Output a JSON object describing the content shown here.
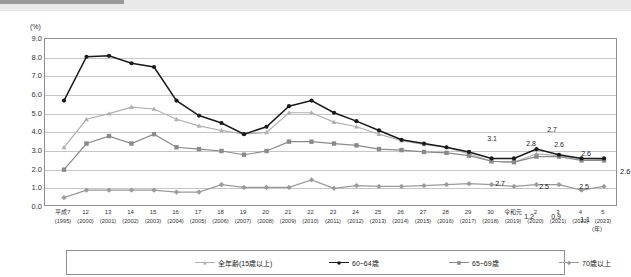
{
  "chart_data": {
    "type": "line",
    "title": "",
    "xlabel": "(年)",
    "ylabel": "(%)",
    "ylim": [
      0.0,
      9.0
    ],
    "yticks": [
      "0.0",
      "1.0",
      "2.0",
      "3.0",
      "4.0",
      "5.0",
      "6.0",
      "7.0",
      "8.0",
      "9.0"
    ],
    "grid": true,
    "legend_position": "bottom",
    "categories": [
      "平成7\n(1995)",
      "12\n(2000)",
      "13\n(2001)",
      "14\n(2002)",
      "15\n(2003)",
      "16\n(2004)",
      "17\n(2005)",
      "18\n(2006)",
      "19\n(2007)",
      "20\n(2008)",
      "21\n(2009)",
      "22\n(2010)",
      "23\n(2011)",
      "24\n(2012)",
      "25\n(2013)",
      "26\n(2014)",
      "27\n(2015)",
      "28\n(2016)",
      "29\n(2017)",
      "30\n(2018)",
      "令和元\n(2019)",
      "2\n(2020)",
      "3\n(2021)",
      "4\n(2022)",
      "5\n(2023)"
    ],
    "x_labels": [
      {
        "line1": "平成7",
        "line2": "(1995)"
      },
      {
        "line1": "12",
        "line2": "(2000)"
      },
      {
        "line1": "13",
        "line2": "(2001)"
      },
      {
        "line1": "14",
        "line2": "(2002)"
      },
      {
        "line1": "15",
        "line2": "(2003)"
      },
      {
        "line1": "16",
        "line2": "(2004)"
      },
      {
        "line1": "17",
        "line2": "(2005)"
      },
      {
        "line1": "18",
        "line2": "(2006)"
      },
      {
        "line1": "19",
        "line2": "(2007)"
      },
      {
        "line1": "20",
        "line2": "(2008)"
      },
      {
        "line1": "21",
        "line2": "(2009)"
      },
      {
        "line1": "22",
        "line2": "(2010)"
      },
      {
        "line1": "23",
        "line2": "(2011)"
      },
      {
        "line1": "24",
        "line2": "(2012)"
      },
      {
        "line1": "25",
        "line2": "(2013)"
      },
      {
        "line1": "26",
        "line2": "(2014)"
      },
      {
        "line1": "27",
        "line2": "(2015)"
      },
      {
        "line1": "28",
        "line2": "(2016)"
      },
      {
        "line1": "29",
        "line2": "(2017)"
      },
      {
        "line1": "30",
        "line2": "(2018)"
      },
      {
        "line1": "令和元",
        "line2": "(2019)"
      },
      {
        "line1": "2",
        "line2": "(2020)"
      },
      {
        "line1": "3",
        "line2": "(2021)"
      },
      {
        "line1": "4",
        "line2": "(2022)"
      },
      {
        "line1": "5",
        "line2": "(2023)"
      }
    ],
    "series": [
      {
        "name": "全年齢(15歳以上)",
        "color": "#b0b0b0",
        "marker": "triangle",
        "values": [
          3.2,
          4.7,
          5.0,
          5.35,
          5.25,
          4.7,
          4.35,
          4.1,
          3.9,
          4.0,
          5.05,
          5.05,
          4.55,
          4.3,
          3.9,
          3.55,
          3.35,
          3.2,
          2.85,
          2.45,
          2.4,
          2.85,
          2.75,
          2.6,
          2.55
        ]
      },
      {
        "name": "60~64歳",
        "color": "#1a1a1a",
        "marker": "circle",
        "values": [
          5.7,
          8.05,
          8.1,
          7.7,
          7.5,
          5.7,
          4.9,
          4.5,
          3.9,
          4.3,
          5.4,
          5.7,
          5.05,
          4.6,
          4.1,
          3.6,
          3.4,
          3.2,
          2.95,
          2.6,
          2.6,
          3.1,
          2.8,
          2.6,
          2.6
        ]
      },
      {
        "name": "65~69歳",
        "color": "#8a8a8a",
        "marker": "square",
        "values": [
          2.0,
          3.4,
          3.8,
          3.4,
          3.9,
          3.2,
          3.1,
          3.0,
          2.8,
          3.0,
          3.5,
          3.5,
          3.4,
          3.3,
          3.1,
          3.05,
          2.95,
          2.9,
          2.75,
          2.45,
          2.4,
          2.7,
          2.7,
          2.5,
          2.5
        ]
      },
      {
        "name": "70歳以上",
        "color": "#9a9a9a",
        "marker": "diamond",
        "values": [
          0.5,
          0.9,
          0.9,
          0.9,
          0.9,
          0.8,
          0.8,
          1.2,
          1.05,
          1.05,
          1.05,
          1.45,
          1.0,
          1.15,
          1.1,
          1.1,
          1.15,
          1.2,
          1.25,
          1.2,
          1.1,
          1.2,
          1.2,
          0.9,
          1.1
        ]
      }
    ],
    "annotations": [
      {
        "text": "3.1",
        "x_index": 21,
        "value": 3.1,
        "series": "60~64歳"
      },
      {
        "text": "2.8",
        "x_index": 22,
        "value": 2.8,
        "series": "60~64歳"
      },
      {
        "text": "2.7",
        "x_index": 23,
        "value": 2.6,
        "series": "60~64歳"
      },
      {
        "text": "2.6",
        "x_index": 23,
        "value": 2.6,
        "series": "60~64歳"
      },
      {
        "text": "2.6",
        "x_index": 24,
        "value": 2.6,
        "series": "60~64歳"
      },
      {
        "text": "2.7",
        "x_index": 21,
        "value": 2.7,
        "series": "65~69歳"
      },
      {
        "text": "2.5",
        "x_index": 23,
        "value": 2.5,
        "series": "65~69歳"
      },
      {
        "text": "2.5",
        "x_index": 24,
        "value": 2.5,
        "series": "65~69歳"
      },
      {
        "text": "1.2",
        "x_index": 22,
        "value": 1.2,
        "series": "70歳以上"
      },
      {
        "text": "0.9",
        "x_index": 23,
        "value": 0.9,
        "series": "70歳以上"
      },
      {
        "text": "1.1",
        "x_index": 24,
        "value": 1.1,
        "series": "70歳以上"
      }
    ],
    "edge_label": "2.6"
  },
  "axis": {
    "y_unit": "(%)",
    "x_unit": "(年)"
  },
  "callouts": [
    {
      "id": "c31",
      "text": "3.1",
      "left": 492,
      "top": 127
    },
    {
      "id": "c28",
      "text": "2.8",
      "left": 531,
      "top": 132
    },
    {
      "id": "c26a",
      "text": "2.6",
      "top": 133,
      "left": 559
    },
    {
      "id": "c27top",
      "text": "2.7",
      "left": 552,
      "top": 118
    },
    {
      "id": "c26b",
      "text": "2.6",
      "left": 586,
      "top": 142
    },
    {
      "id": "c27low",
      "text": "2.7",
      "left": 500,
      "top": 172
    },
    {
      "id": "c25a",
      "text": "2.5",
      "left": 544,
      "top": 175
    },
    {
      "id": "c25b",
      "text": "2.5",
      "left": 584,
      "top": 175
    },
    {
      "id": "c12",
      "text": "1.2",
      "left": 529,
      "top": 205
    },
    {
      "id": "c09",
      "text": "0.9",
      "left": 556,
      "top": 205
    },
    {
      "id": "c11",
      "text": "1.1",
      "left": 585,
      "top": 208
    }
  ],
  "legend": {
    "items": [
      {
        "label": "全年齢(15歳以上)",
        "color": "#b0b0b0",
        "marker": "triangle",
        "left": 128
      },
      {
        "label": "60~64歳",
        "color": "#1a1a1a",
        "marker": "circle",
        "left": 262
      },
      {
        "label": "65~69歳",
        "color": "#8a8a8a",
        "marker": "square",
        "left": 382
      },
      {
        "label": "70歳以上",
        "color": "#9a9a9a",
        "marker": "diamond",
        "left": 492
      }
    ]
  }
}
